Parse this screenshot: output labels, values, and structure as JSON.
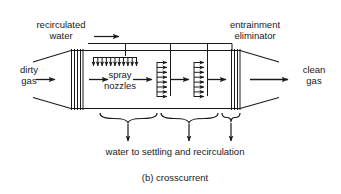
{
  "figure": {
    "caption": "(b) crosscurrent",
    "type": "process-flow-diagram"
  },
  "labels": {
    "recirculated_water": "recirculated\nwater",
    "entrainment_eliminator": "entrainment\neliminator",
    "dirty_gas": "dirty\ngas",
    "clean_gas": "clean\ngas",
    "spray_nozzles": "spray\nnozzles",
    "water_to_settling": "water to settling and recirculation"
  },
  "colors": {
    "line": "#1a1a1a",
    "text": "#1a1a1a",
    "background": "#ffffff"
  },
  "components": {
    "inlet_cone": "tapered gas inlet",
    "outlet_cone": "tapered gas outlet",
    "left_wall": "flow distribution grid",
    "right_wall": "entrainment eliminator grid",
    "header_pipe": "recirculated water header",
    "nozzle_bank_count": 3,
    "downward_nozzle_ticks": 11,
    "cross_spray_arrows_per_bank": 8,
    "collection_braces": 3,
    "drain_arrows": 3
  }
}
